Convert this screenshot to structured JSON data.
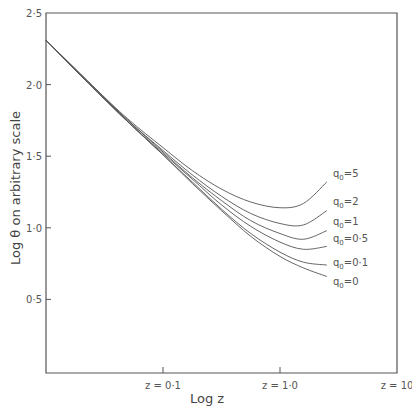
{
  "chart_data": {
    "type": "line",
    "title": "",
    "xlabel": "Log z",
    "ylabel": "Log θ  on arbitrary scale",
    "xlim": [
      -2,
      1
    ],
    "ylim": [
      0,
      2.5
    ],
    "grid": false,
    "legend_position": "inline labels at right end of curves",
    "x_ticks": [
      {
        "value": -1,
        "label": "z = 0·1"
      },
      {
        "value": 0,
        "label": "z = 1·0"
      },
      {
        "value": 1,
        "label": "z = 10"
      }
    ],
    "y_ticks": [
      {
        "value": 2.5,
        "label": "2·5"
      },
      {
        "value": 2.0,
        "label": "2·0"
      },
      {
        "value": 1.5,
        "label": "1·5"
      },
      {
        "value": 1.0,
        "label": "1·0"
      },
      {
        "value": 0.5,
        "label": "0·5"
      }
    ],
    "x": [
      -2.0,
      -1.6,
      -1.3,
      -1.0,
      -0.75,
      -0.5,
      -0.25,
      0.0,
      0.2,
      0.4
    ],
    "series": [
      {
        "name": "q0=5",
        "label_main": "q",
        "label_sub": "0",
        "label_rest": "=5",
        "values": [
          2.31,
          1.99,
          1.76,
          1.56,
          1.4,
          1.27,
          1.18,
          1.14,
          1.17,
          1.32
        ]
      },
      {
        "name": "q0=2",
        "label_main": "q",
        "label_sub": "0",
        "label_rest": "=2",
        "values": [
          2.31,
          1.99,
          1.75,
          1.54,
          1.37,
          1.22,
          1.1,
          1.03,
          1.02,
          1.12
        ]
      },
      {
        "name": "q0=1",
        "label_main": "q",
        "label_sub": "0",
        "label_rest": "=1",
        "values": [
          2.31,
          1.98,
          1.75,
          1.53,
          1.35,
          1.19,
          1.05,
          0.96,
          0.92,
          0.98
        ]
      },
      {
        "name": "q0=0.5",
        "label_main": "q",
        "label_sub": "0",
        "label_rest": "=0·5",
        "values": [
          2.31,
          1.98,
          1.74,
          1.52,
          1.34,
          1.16,
          1.01,
          0.9,
          0.85,
          0.87
        ]
      },
      {
        "name": "q0=0.1",
        "label_main": "q",
        "label_sub": "0",
        "label_rest": "=0·1",
        "values": [
          2.31,
          1.98,
          1.74,
          1.51,
          1.32,
          1.13,
          0.96,
          0.83,
          0.76,
          0.74
        ]
      },
      {
        "name": "q0=0",
        "label_main": "q",
        "label_sub": "0",
        "label_rest": "=0",
        "values": [
          2.31,
          1.98,
          1.74,
          1.51,
          1.31,
          1.12,
          0.94,
          0.8,
          0.72,
          0.66
        ]
      }
    ],
    "label_offsets_y": [
      1.38,
      1.19,
      1.05,
      0.93,
      0.76,
      0.63
    ]
  },
  "caption": "...fitted between different Friedmann models (caption cut off)"
}
